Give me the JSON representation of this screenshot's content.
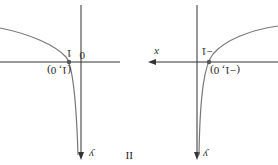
{
  "orientation": "rotated 180 degrees",
  "left_graph": {
    "origin_label": "0",
    "x_tick_label": "1",
    "point_label": "(1, 0)",
    "y_axis_label": "y",
    "caption": "II"
  },
  "right_graph": {
    "x_axis_label": "x",
    "x_tick_label": "−1",
    "point_label": "(−1, 0)",
    "y_axis_label": "y"
  },
  "colors": {
    "axis": "#333333",
    "curve": "#777777",
    "point": "#555555"
  }
}
